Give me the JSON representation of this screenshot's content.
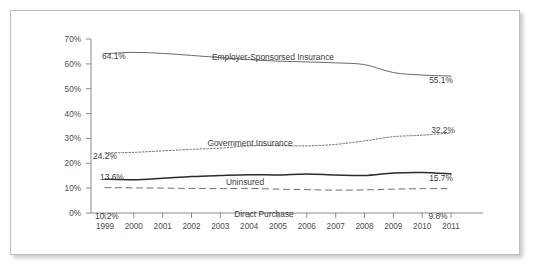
{
  "chart_data": {
    "type": "line",
    "title": "",
    "subtitle": "",
    "xlabel": "",
    "ylabel": "",
    "grid": false,
    "legend_position": "inline-annotations",
    "x": [
      1999,
      2000,
      2001,
      2002,
      2003,
      2004,
      2005,
      2006,
      2007,
      2008,
      2009,
      2010,
      2011
    ],
    "categories": [
      "1999",
      "2000",
      "2001",
      "2002",
      "2003",
      "2004",
      "2005",
      "2006",
      "2007",
      "2008",
      "2009",
      "2010",
      "2011"
    ],
    "ylim": [
      0,
      70
    ],
    "yticks": [
      0,
      10,
      20,
      30,
      40,
      50,
      60,
      70
    ],
    "ytick_labels": [
      "0%",
      "10%",
      "20%",
      "30%",
      "40%",
      "50%",
      "60%",
      "70%"
    ],
    "series": [
      {
        "name": "Employer-Sponsorsed Insurance",
        "style": "solid",
        "color": "#6b6b6b",
        "values": [
          64.1,
          64.6,
          64.2,
          63.4,
          62.5,
          61.7,
          61.1,
          60.8,
          60.4,
          59.7,
          56.5,
          55.5,
          55.1
        ],
        "start_label": "64.1%",
        "end_label": "55.1%"
      },
      {
        "name": "Government Insurance",
        "style": "dotted",
        "color": "#6b6b6b",
        "values": [
          24.2,
          24.4,
          25.0,
          25.6,
          26.1,
          27.0,
          27.1,
          27.0,
          27.6,
          29.0,
          30.7,
          31.3,
          32.2
        ],
        "start_label": "24.2%",
        "end_label": "32.2%"
      },
      {
        "name": "Uninsured",
        "style": "solid",
        "color": "#2b2b2b",
        "values": [
          13.6,
          13.4,
          14.0,
          14.7,
          15.1,
          15.4,
          15.3,
          15.7,
          15.3,
          15.1,
          16.1,
          16.3,
          15.7
        ],
        "start_label": "13.6%",
        "end_label": "15.7%"
      },
      {
        "name": "Direct Purchase",
        "style": "dashed",
        "color": "#6b6b6b",
        "values": [
          10.2,
          10.1,
          10.0,
          9.9,
          9.8,
          9.9,
          9.6,
          9.4,
          9.2,
          9.3,
          9.6,
          9.8,
          9.8
        ],
        "start_label": "10.2%",
        "end_label": "9.8%"
      }
    ]
  },
  "annotations": {
    "esi_label": "Employer-Sponsorsed Insurance",
    "gov_label": "Government Insurance",
    "unins_label": "Uninsured",
    "direct_label": "Direct Purchase",
    "esi_start": "64.1%",
    "esi_end": "55.1%",
    "gov_start": "24.2%",
    "gov_end": "32.2%",
    "unins_start": "13.6%",
    "unins_end": "15.7%",
    "direct_start": "10.2%",
    "direct_end": "9.8%"
  },
  "axis": {
    "y_labels": [
      "70%",
      "60%",
      "50%",
      "40%",
      "30%",
      "20%",
      "10%",
      "0%"
    ],
    "x_labels": [
      "1999",
      "2000",
      "2001",
      "2002",
      "2003",
      "2004",
      "2005",
      "2006",
      "2007",
      "2008",
      "2009",
      "2010",
      "2011"
    ]
  },
  "colors": {
    "frame": "#bdbdbd",
    "axis": "#8a8a8a",
    "text": "#4d4d4d",
    "line_light": "#6b6b6b",
    "line_dark": "#2b2b2b",
    "background": "#ffffff"
  }
}
